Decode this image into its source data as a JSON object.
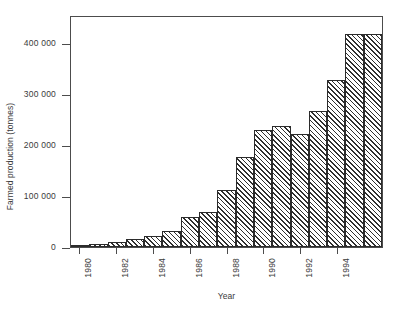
{
  "chart_data": {
    "type": "bar",
    "title": "",
    "xlabel": "Year",
    "ylabel": "Farmed production (tonnes)",
    "categories": [
      "1980",
      "1981",
      "1982",
      "1983",
      "1984",
      "1985",
      "1986",
      "1987",
      "1988",
      "1989",
      "1990",
      "1991",
      "1992",
      "1993",
      "1994",
      "1995",
      "1996"
    ],
    "values": [
      3000,
      6000,
      10000,
      15000,
      22000,
      32000,
      59000,
      68000,
      112000,
      177000,
      229000,
      237000,
      221000,
      266000,
      327000,
      417000,
      417000
    ],
    "series": [
      {
        "name": "Farmed production",
        "values": [
          3000,
          6000,
          10000,
          15000,
          22000,
          32000,
          59000,
          68000,
          112000,
          177000,
          229000,
          237000,
          221000,
          266000,
          327000,
          417000,
          417000
        ]
      }
    ],
    "ylim": [
      0,
      455000
    ],
    "yticks": [
      0,
      100000,
      200000,
      300000,
      400000
    ],
    "ytick_labels": [
      "0",
      "100 000",
      "200 000",
      "300 000",
      "400 000"
    ],
    "xtick_labels": [
      "1980",
      "1982",
      "1984",
      "1986",
      "1988",
      "1990",
      "1992",
      "1994"
    ],
    "xtick_categories": [
      "1980",
      "1982",
      "1984",
      "1986",
      "1988",
      "1990",
      "1992",
      "1994"
    ],
    "grid": false,
    "legend": null,
    "bar_fill": "hatch-diagonal",
    "bar_edge_color": "#2b2b2b",
    "axis_color": "#4c4c4c",
    "background": "#ffffff"
  }
}
